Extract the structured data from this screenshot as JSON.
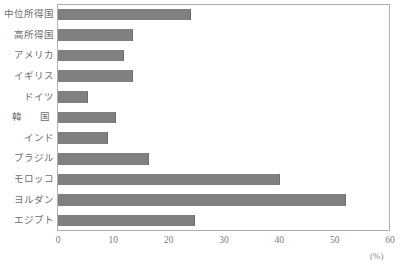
{
  "chart_data": {
    "type": "bar",
    "orientation": "horizontal",
    "title": "",
    "xlabel": "(%)",
    "ylabel": "",
    "xlim": [
      0,
      60
    ],
    "xticks": [
      0,
      10,
      20,
      30,
      40,
      50,
      60
    ],
    "grid": false,
    "legend": null,
    "bar_color": "#808080",
    "frame_color": "#aeaeae",
    "categories": [
      "中位所得国",
      "高所得国",
      "アメリカ",
      "イギリス",
      "ドイツ",
      "韓　国",
      "インド",
      "ブラジル",
      "モロッコ",
      "ヨルダン",
      "エジプト"
    ],
    "values": [
      24.0,
      13.5,
      12.0,
      13.5,
      5.5,
      10.5,
      9.0,
      16.5,
      40.2,
      52.0,
      24.7
    ],
    "unit": "%"
  },
  "axis": {
    "unit_label": "(%)",
    "tick_labels": [
      "0",
      "10",
      "20",
      "30",
      "40",
      "50",
      "60"
    ]
  }
}
